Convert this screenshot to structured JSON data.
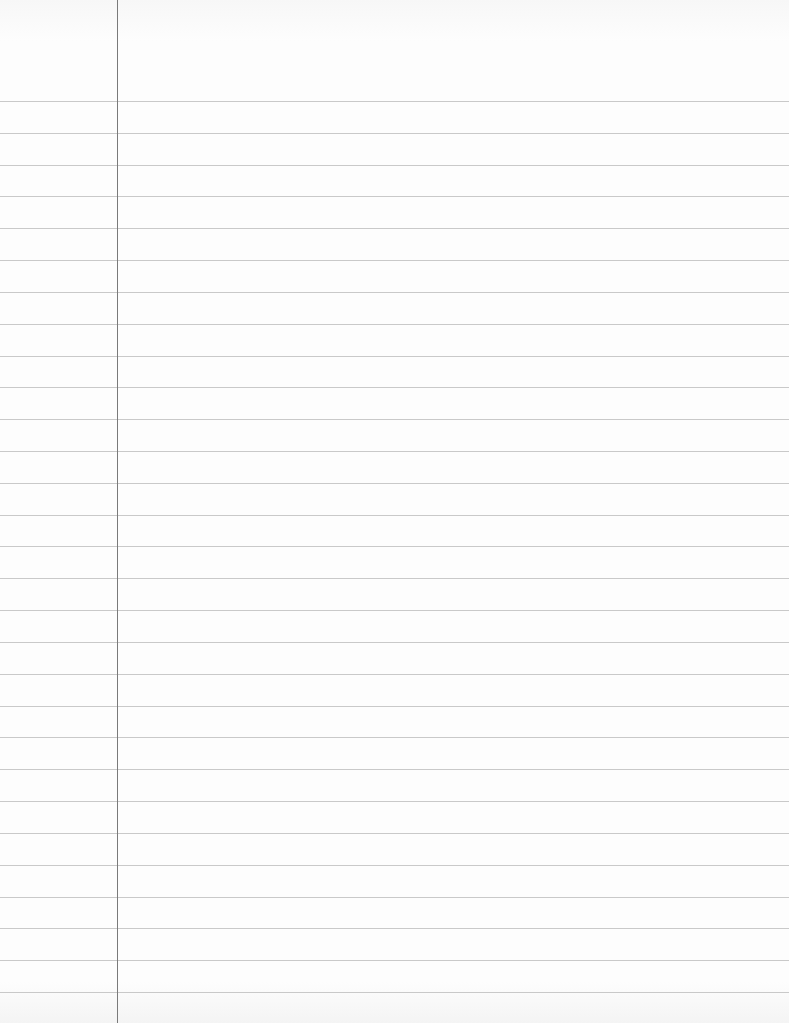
{
  "page": {
    "type": "lined-notebook-paper",
    "background_color": "#fdfdfd",
    "rule_color": "#c9c9c9",
    "margin_color": "#7a7a7a",
    "margin_x": 117,
    "first_rule_y": 101,
    "rule_spacing": 31.82,
    "rule_count": 29
  }
}
